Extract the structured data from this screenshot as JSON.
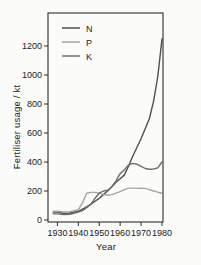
{
  "figure": {
    "background": "#fbfbf9",
    "axis_color": "#2e2e2e",
    "text_color": "#222222",
    "tick_font_px": 9
  },
  "chart_data": {
    "type": "line",
    "title": "",
    "xlabel": "Year",
    "ylabel": "Fertiliser usage / kt",
    "xlim": [
      1925.5,
      1980.5
    ],
    "ylim": [
      0,
      1440
    ],
    "x_ticks": [
      1930,
      1940,
      1950,
      1960,
      1970,
      1980
    ],
    "y_ticks": [
      0,
      200,
      400,
      600,
      800,
      1000,
      1200
    ],
    "grid": false,
    "legend_position": "top-left-inside",
    "x": [
      1928,
      1930,
      1933,
      1936,
      1940,
      1942,
      1944,
      1946,
      1948,
      1950,
      1952,
      1954,
      1956,
      1958,
      1960,
      1962,
      1964,
      1966,
      1968,
      1970,
      1972,
      1974,
      1976,
      1978,
      1980
    ],
    "series": [
      {
        "name": "N",
        "color": "#4f4f4f",
        "values": [
          55,
          55,
          45,
          48,
          60,
          75,
          90,
          110,
          130,
          150,
          175,
          200,
          230,
          260,
          285,
          310,
          370,
          440,
          500,
          560,
          630,
          700,
          820,
          990,
          1250
        ]
      },
      {
        "name": "P",
        "color": "#a6a6a6",
        "values": [
          60,
          60,
          55,
          58,
          70,
          120,
          185,
          190,
          190,
          185,
          175,
          170,
          175,
          185,
          195,
          210,
          220,
          220,
          218,
          220,
          218,
          210,
          200,
          192,
          185
        ]
      },
      {
        "name": "K",
        "color": "#6e6e6e",
        "values": [
          42,
          42,
          38,
          40,
          55,
          65,
          85,
          110,
          150,
          185,
          200,
          205,
          230,
          270,
          320,
          345,
          380,
          390,
          385,
          370,
          355,
          350,
          352,
          360,
          400
        ]
      }
    ]
  }
}
